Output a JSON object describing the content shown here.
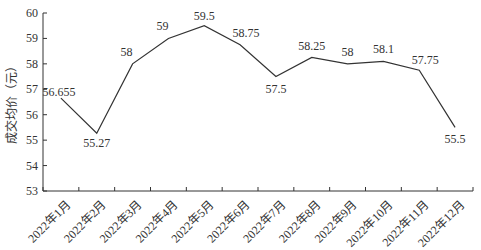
{
  "chart_data": {
    "type": "line",
    "title": "",
    "xlabel": "",
    "ylabel": "成交均价（元）",
    "categories": [
      "2022年1月",
      "2022年2月",
      "2022年3月",
      "2022年4月",
      "2022年5月",
      "2022年6月",
      "2022年7月",
      "2022年8月",
      "2022年9月",
      "2022年10月",
      "2022年11月",
      "2022年12月"
    ],
    "series": [
      {
        "name": "成交均价",
        "values": [
          56.655,
          55.27,
          58,
          59,
          59.5,
          58.75,
          57.5,
          58.25,
          58,
          58.1,
          57.75,
          55.5
        ],
        "labels": [
          "56.655",
          "55.27",
          "58",
          "59",
          "59.5",
          "58.75",
          "57.5",
          "58.25",
          "58",
          "58.1",
          "57.75",
          "55.5"
        ],
        "color": "#333333"
      }
    ],
    "ylim": [
      53,
      60
    ],
    "yticks": [
      53,
      54,
      55,
      56,
      57,
      58,
      59,
      60
    ],
    "grid": false,
    "legend": null
  },
  "colors": {
    "line": "#333333",
    "axis": "#333333",
    "text": "#333333"
  }
}
